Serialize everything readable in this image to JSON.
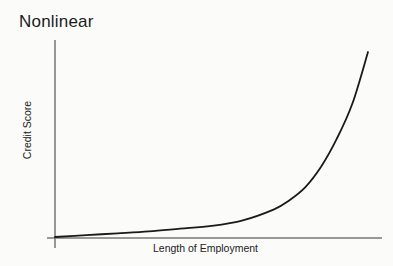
{
  "chart_data": {
    "type": "line",
    "title": "Nonlinear",
    "xlabel": "Length of Employment",
    "ylabel": "Credit Score",
    "grid": false,
    "legend": null,
    "ticks": false,
    "x": [
      0,
      0.1,
      0.2,
      0.3,
      0.4,
      0.5,
      0.6,
      0.7,
      0.75,
      0.8,
      0.85,
      0.9,
      0.95,
      1.0
    ],
    "series": [
      {
        "name": "Credit Score",
        "values": [
          0.0,
          0.01,
          0.02,
          0.03,
          0.045,
          0.06,
          0.09,
          0.15,
          0.2,
          0.27,
          0.38,
          0.53,
          0.72,
          1.0
        ]
      }
    ],
    "xlim": [
      0,
      1
    ],
    "ylim": [
      0,
      1
    ],
    "annotations": "Qualitative exponential-shaped curve; no numeric tick labels shown",
    "colors": {
      "line": "#1a1a1a",
      "axis": "#555555",
      "background": "#fbfbfa"
    }
  }
}
